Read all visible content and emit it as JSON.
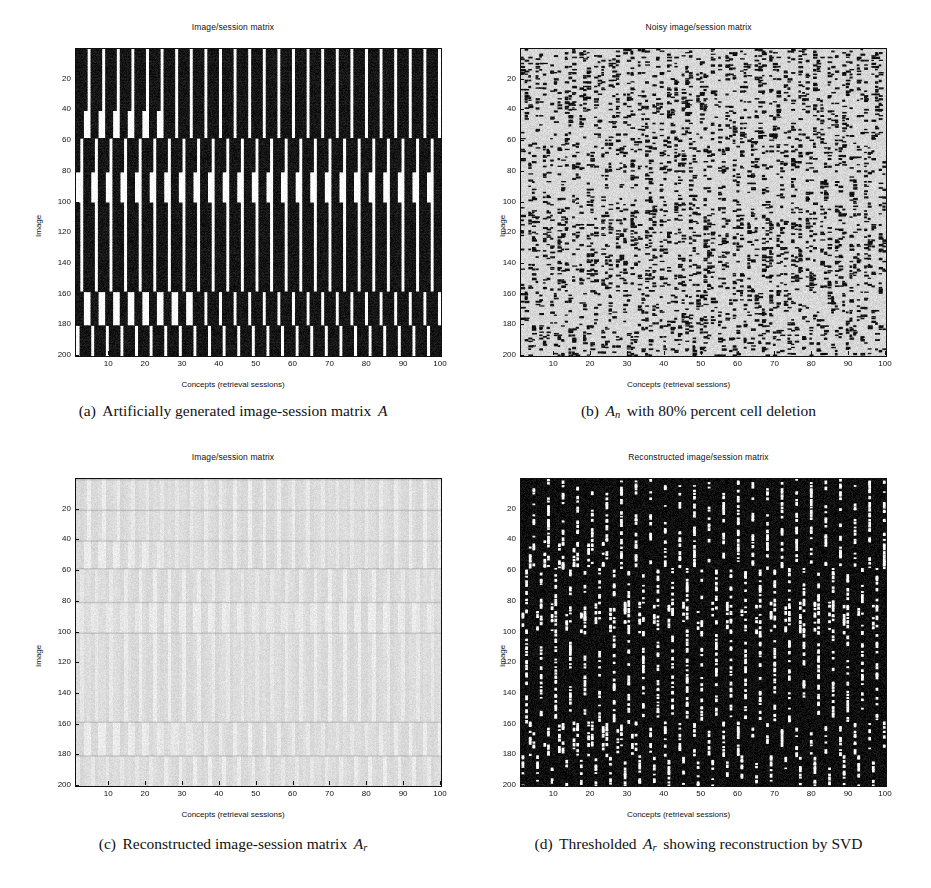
{
  "figure": {
    "width": 931,
    "height": 888,
    "panel_count": 4
  },
  "axis": {
    "xlabel": "Concepts (retrieval sessions)",
    "ylabel": "Image",
    "xticks": [
      10,
      20,
      30,
      40,
      50,
      60,
      70,
      80,
      90,
      100
    ],
    "yticks": [
      20,
      40,
      60,
      80,
      100,
      120,
      140,
      160,
      180,
      200
    ],
    "xlim": [
      1,
      100
    ],
    "ylim": [
      1,
      200
    ]
  },
  "panels": [
    {
      "id": "a",
      "title": "Image/session matrix",
      "caption_prefix": "(a)",
      "caption_text": "Artificially generated image-session matrix",
      "caption_symbol": "A",
      "caption_subscript": "",
      "background": "#101010",
      "foreground": "#ffffff"
    },
    {
      "id": "b",
      "title": "Noisy image/session matrix",
      "caption_prefix": "(b)",
      "caption_text": "with 80% percent cell deletion",
      "caption_symbol": "A",
      "caption_subscript": "n",
      "background": "#d7d7d7",
      "foreground": "#101010"
    },
    {
      "id": "c",
      "title": "Image/session matrix",
      "caption_prefix": "(c)",
      "caption_text": "Reconstructed image-session matrix",
      "caption_symbol": "A",
      "caption_subscript": "r",
      "background": "#f0f0f0",
      "foreground": "#9a9a9a"
    },
    {
      "id": "d",
      "title": "Reconstructed image/session matrix",
      "caption_prefix": "(d)",
      "caption_text": "Thresholded",
      "caption_text_after": "showing reconstruction by SVD",
      "caption_symbol": "A",
      "caption_subscript": "r",
      "background": "#0d0d0d",
      "foreground": "#ffffff"
    }
  ],
  "chart_data": {
    "type": "heatmap",
    "xlabel": "Concepts (retrieval sessions)",
    "ylabel": "Image",
    "xlim": [
      1,
      100
    ],
    "ylim": [
      1,
      200
    ],
    "grid": false,
    "legend": "none",
    "matrix_rows": 200,
    "matrix_cols": 100,
    "panels": [
      {
        "id": "a",
        "title": "Image/session matrix",
        "description": "Binary block-structured matrix: horizontal bands of images sharing concepts; white vertical stripes mark cells with value 1 against black 0 background.",
        "bands": [
          {
            "row_start": 1,
            "row_end": 20,
            "stripe_phase": 0.0
          },
          {
            "row_start": 21,
            "row_end": 40,
            "stripe_phase": 0.28
          },
          {
            "row_start": 41,
            "row_end": 58,
            "stripe_phase": 0.55
          },
          {
            "row_start": 59,
            "row_end": 80,
            "stripe_phase": 0.14
          },
          {
            "row_start": 81,
            "row_end": 100,
            "stripe_phase": 0.68
          },
          {
            "row_start": 101,
            "row_end": 158,
            "stripe_phase": 0.4
          },
          {
            "row_start": 159,
            "row_end": 180,
            "stripe_phase": 0.05
          },
          {
            "row_start": 181,
            "row_end": 200,
            "stripe_phase": 0.47
          }
        ],
        "stripe_period_cols": 4,
        "fill_fraction": 0.72
      },
      {
        "id": "b",
        "title": "Noisy image/session matrix",
        "description": "Matrix A after deleting 80% of cells; remaining 20% of entries shown as dark speckles on light background.",
        "deletion_percent": 80,
        "retained_percent": 20
      },
      {
        "id": "c",
        "title": "Image/session matrix",
        "description": "Low-rank SVD reconstruction A_r shown with continuous grayscale; faint vertical concept streaks visible.",
        "value_range": [
          0,
          1
        ]
      },
      {
        "id": "d",
        "title": "Reconstructed image/session matrix",
        "description": "Thresholded A_r: recovered 1-entries appear as white dashes on black, recovering the band structure of A.",
        "threshold_applied": true
      }
    ]
  }
}
